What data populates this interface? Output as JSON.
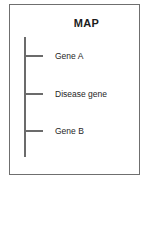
{
  "figure": {
    "title": "MAP",
    "panel_border_color": "#6f6f6f",
    "line_color": "#6b6b6b",
    "text_color": "#262626",
    "background_color": "#ffffff"
  },
  "chart_data": {
    "type": "scatter",
    "title": "MAP",
    "subtitle": "",
    "xlabel": "",
    "ylabel": "",
    "orientation": "vertical",
    "axis_description": "genetic linkage map: a single vertical chromosome line with three tick-marked loci",
    "grid": false,
    "legend_position": "none",
    "categories": [
      "Gene A",
      "Disease gene",
      "Gene B"
    ],
    "values": [
      1,
      2,
      3
    ],
    "loci": [
      {
        "label": "Gene A",
        "order": 1
      },
      {
        "label": "Disease gene",
        "order": 2
      },
      {
        "label": "Gene B",
        "order": 3
      }
    ]
  }
}
